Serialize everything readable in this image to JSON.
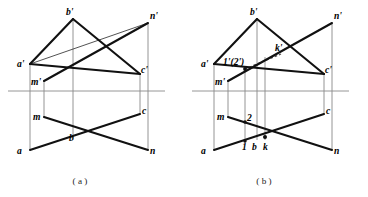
{
  "figure": {
    "background_color": "#ffffff",
    "line_color": "#111111",
    "projector_color": "#7a7a7a",
    "ground_line_color": "#8a8a8a",
    "dashed_color": "#555555",
    "width": 368,
    "height": 197
  },
  "panels": [
    {
      "id": "panel-a",
      "caption": "( a )",
      "caption_x": 80,
      "caption_y": 184,
      "ground_line": {
        "x1": 8,
        "y1": 91,
        "x2": 165,
        "y2": 91
      },
      "points": {
        "b_prime": {
          "label": "b'",
          "x": 73,
          "y": 19,
          "lx": 66,
          "ly": 15
        },
        "n_prime": {
          "label": "n'",
          "x": 148,
          "y": 23,
          "lx": 150,
          "ly": 19
        },
        "a_prime": {
          "label": "a'",
          "x": 30,
          "y": 64,
          "lx": 17,
          "ly": 63
        },
        "c_prime": {
          "label": "c'",
          "x": 140,
          "y": 74,
          "lx": 141,
          "ly": 73
        },
        "m_prime": {
          "label": "m'",
          "x": 44,
          "y": 81,
          "lx": 32,
          "ly": 82
        },
        "m": {
          "label": "m",
          "x": 44,
          "y": 117,
          "lx": 33,
          "ly": 119
        },
        "c": {
          "label": "c",
          "x": 140,
          "y": 114,
          "lx": 142,
          "ly": 114
        },
        "a": {
          "label": "a",
          "x": 30,
          "y": 150,
          "lx": 17,
          "ly": 152
        },
        "b": {
          "label": "b",
          "x": 73,
          "y": 140,
          "lx": 69,
          "ly": 138
        },
        "n": {
          "label": "n",
          "x": 148,
          "y": 150,
          "lx": 150,
          "ly": 152
        }
      },
      "solid_edges": [
        {
          "name": "edge-a-prime-b-prime",
          "x1": 30,
          "y1": 64,
          "x2": 73,
          "y2": 19
        },
        {
          "name": "edge-b-prime-c-prime",
          "x1": 73,
          "y1": 19,
          "x2": 140,
          "y2": 74
        },
        {
          "name": "edge-a-prime-c-prime",
          "x1": 30,
          "y1": 64,
          "x2": 140,
          "y2": 74
        },
        {
          "name": "edge-m-prime-n-prime",
          "x1": 44,
          "y1": 81,
          "x2": 148,
          "y2": 23
        },
        {
          "name": "edge-a-b-plan",
          "x1": 30,
          "y1": 150,
          "x2": 140,
          "y2": 114
        },
        {
          "name": "edge-m-n-plan",
          "x1": 44,
          "y1": 117,
          "x2": 148,
          "y2": 150
        }
      ],
      "thin_edges": [
        {
          "name": "thin-edge-a-prime-n-prime",
          "x1": 30,
          "y1": 64,
          "x2": 148,
          "y2": 23
        }
      ],
      "projectors": [
        {
          "name": "projector-a",
          "x": 30,
          "y1": 64,
          "y2": 150
        },
        {
          "name": "projector-m",
          "x": 44,
          "y1": 81,
          "y2": 117
        },
        {
          "name": "projector-b",
          "x": 73,
          "y1": 19,
          "y2": 140
        },
        {
          "name": "projector-c",
          "x": 140,
          "y1": 74,
          "y2": 114
        },
        {
          "name": "projector-n",
          "x": 148,
          "y1": 23,
          "y2": 150
        }
      ]
    },
    {
      "id": "panel-b",
      "caption": "( b )",
      "caption_x": 80,
      "caption_y": 184,
      "ground_line": {
        "x1": 8,
        "y1": 91,
        "x2": 165,
        "y2": 91
      },
      "points": {
        "b_prime": {
          "label": "b'",
          "x": 73,
          "y": 19,
          "lx": 66,
          "ly": 15
        },
        "n_prime": {
          "label": "n'",
          "x": 148,
          "y": 23,
          "lx": 150,
          "ly": 19
        },
        "a_prime": {
          "label": "a'",
          "x": 30,
          "y": 64,
          "lx": 17,
          "ly": 63
        },
        "k_prime": {
          "label": "k'",
          "x": 96,
          "y": 55,
          "lx": 92,
          "ly": 50
        },
        "one_two": {
          "label": "1'(2')",
          "x": 61,
          "y": 69,
          "lx": 40,
          "ly": 63
        },
        "c_prime": {
          "label": "c'",
          "x": 140,
          "y": 74,
          "lx": 141,
          "ly": 73
        },
        "m_prime": {
          "label": "m'",
          "x": 44,
          "y": 81,
          "lx": 32,
          "ly": 82
        },
        "m": {
          "label": "m",
          "x": 44,
          "y": 117,
          "lx": 33,
          "ly": 119
        },
        "two": {
          "label": "2",
          "x": 61,
          "y": 122,
          "lx": 63,
          "ly": 120
        },
        "c": {
          "label": "c",
          "x": 140,
          "y": 114,
          "lx": 142,
          "ly": 114
        },
        "a": {
          "label": "a",
          "x": 30,
          "y": 150,
          "lx": 17,
          "ly": 152
        },
        "one": {
          "label": "1",
          "x": 61,
          "y": 141,
          "lx": 59,
          "ly": 148
        },
        "b": {
          "label": "b",
          "x": 73,
          "y": 140,
          "lx": 70,
          "ly": 148
        },
        "k": {
          "label": "k",
          "x": 81,
          "y": 137,
          "lx": 81,
          "ly": 148
        },
        "n": {
          "label": "n",
          "x": 148,
          "y": 150,
          "lx": 150,
          "ly": 152
        }
      },
      "solid_edges": [
        {
          "name": "edge-a-prime-b-prime",
          "x1": 30,
          "y1": 64,
          "x2": 73,
          "y2": 19
        },
        {
          "name": "edge-b-prime-c-prime",
          "x1": 73,
          "y1": 19,
          "x2": 140,
          "y2": 74
        },
        {
          "name": "edge-a-prime-c-prime",
          "x1": 30,
          "y1": 64,
          "x2": 140,
          "y2": 74
        },
        {
          "name": "edge-m-prime-n-prime",
          "x1": 44,
          "y1": 81,
          "x2": 148,
          "y2": 23
        },
        {
          "name": "edge-a-b-plan",
          "x1": 30,
          "y1": 150,
          "x2": 140,
          "y2": 114
        },
        {
          "name": "edge-m-n-plan",
          "x1": 44,
          "y1": 117,
          "x2": 148,
          "y2": 150
        }
      ],
      "thin_edges": [],
      "dashed_edges": [
        {
          "name": "dashed-visibility-ray",
          "x1": 61,
          "y1": 69,
          "x2": 97,
          "y2": 54
        }
      ],
      "projectors": [
        {
          "name": "projector-a",
          "x": 30,
          "y1": 64,
          "y2": 150
        },
        {
          "name": "projector-m",
          "x": 44,
          "y1": 81,
          "y2": 117
        },
        {
          "name": "projector-12",
          "x": 61,
          "y1": 69,
          "y2": 143
        },
        {
          "name": "projector-b",
          "x": 73,
          "y1": 19,
          "y2": 140
        },
        {
          "name": "projector-k",
          "x": 81,
          "y1": 57,
          "y2": 140
        },
        {
          "name": "projector-c",
          "x": 140,
          "y1": 74,
          "y2": 114
        },
        {
          "name": "projector-n",
          "x": 148,
          "y1": 23,
          "y2": 150
        }
      ],
      "dots": [
        {
          "name": "dot-1-2-front",
          "x": 61,
          "y": 69
        },
        {
          "name": "dot-2-plan",
          "x": 61,
          "y": 122
        },
        {
          "name": "dot-1-plan",
          "x": 61,
          "y": 141
        },
        {
          "name": "dot-k-plan",
          "x": 81,
          "y": 137
        }
      ]
    }
  ]
}
